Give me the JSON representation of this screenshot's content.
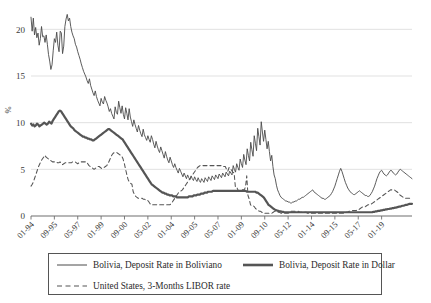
{
  "chart_data": {
    "type": "line",
    "title": "",
    "subtitle": "",
    "xlabel": "",
    "ylabel": "%",
    "ylim": [
      0,
      22.5
    ],
    "yticks": [
      0,
      5,
      10,
      15,
      20
    ],
    "grid": "horizontal",
    "legend_position": "bottom",
    "xtick_labels": [
      "01-94",
      "09-95",
      "05-97",
      "01-99",
      "09-00",
      "05-02",
      "01-04",
      "09-05",
      "05-07",
      "01-09",
      "09-10",
      "05-12",
      "01-14",
      "09-15",
      "05-17",
      "01-19"
    ],
    "x_start": "01-1994",
    "x_end": "2020",
    "x_tick_interval_months": 20,
    "series": [
      {
        "name": "Bolivia, Deposit Rate in Boliviano",
        "style": "solid-thin",
        "color": "#4a4a4a",
        "values": [
          21.3,
          19.8,
          21.2,
          19.4,
          20.2,
          19.1,
          19.6,
          18.3,
          19.0,
          20.3,
          19.2,
          19.3,
          18.6,
          19.4,
          18.4,
          17.3,
          16.6,
          15.7,
          16.2,
          17.7,
          19.0,
          18.6,
          19.7,
          18.3,
          17.6,
          19.8,
          19.6,
          17.4,
          18.2,
          20.3,
          21.1,
          21.6,
          20.9,
          21.2,
          20.3,
          19.7,
          19.3,
          19.0,
          18.4,
          18.1,
          17.6,
          17.2,
          16.8,
          16.3,
          15.9,
          15.5,
          15.2,
          14.9,
          14.5,
          14.2,
          14.7,
          14.0,
          13.6,
          13.2,
          12.9,
          13.4,
          12.8,
          12.4,
          12.1,
          11.8,
          12.6,
          12.2,
          12.0,
          12.8,
          12.4,
          12.1,
          11.7,
          11.2,
          11.5,
          11.0,
          10.7,
          10.4,
          11.7,
          11.1,
          10.9,
          12.3,
          11.6,
          11.0,
          11.8,
          10.9,
          10.4,
          11.6,
          11.0,
          10.3,
          11.5,
          10.6,
          10.1,
          9.6,
          10.3,
          9.8,
          9.4,
          9.0,
          9.7,
          9.2,
          8.8,
          8.5,
          9.3,
          8.7,
          8.4,
          8.1,
          8.6,
          8.2,
          7.9,
          8.6,
          8.2,
          7.7,
          7.3,
          8.0,
          7.5,
          7.1,
          6.8,
          7.4,
          7.0,
          6.6,
          6.2,
          6.9,
          6.4,
          6.0,
          5.7,
          6.3,
          5.9,
          5.5,
          5.2,
          5.6,
          5.2,
          4.9,
          4.6,
          5.1,
          4.8,
          4.5,
          4.2,
          4.6,
          4.3,
          4.0,
          4.4,
          4.1,
          3.9,
          4.3,
          4.0,
          3.8,
          4.2,
          3.9,
          3.7,
          4.1,
          3.8,
          3.6,
          4.0,
          3.8,
          3.6,
          4.1,
          3.9,
          3.7,
          4.2,
          4.0,
          3.8,
          4.3,
          4.1,
          3.9,
          4.4,
          4.2,
          4.0,
          4.5,
          4.3,
          4.1,
          4.6,
          4.4,
          4.2,
          4.7,
          4.5,
          4.3,
          4.8,
          4.6,
          4.4,
          5.4,
          5.0,
          4.7,
          5.6,
          5.2,
          4.9,
          6.1,
          5.6,
          5.2,
          6.6,
          6.0,
          5.5,
          7.2,
          6.5,
          5.9,
          7.9,
          7.1,
          6.4,
          8.6,
          7.8,
          7.0,
          9.4,
          8.5,
          7.6,
          10.1,
          9.0,
          8.0,
          9.2,
          8.2,
          7.2,
          8.0,
          6.9,
          5.9,
          6.5,
          5.3,
          4.4,
          4.0,
          3.3,
          2.8,
          2.5,
          2.2,
          2.0,
          1.9,
          1.8,
          1.7,
          1.6,
          1.6,
          1.5,
          1.5,
          1.4,
          1.4,
          1.5,
          1.5,
          1.6,
          1.6,
          1.7,
          1.8,
          1.8,
          1.9,
          2.0,
          2.0,
          2.1,
          2.2,
          2.3,
          2.4,
          2.5,
          2.6,
          2.7,
          2.8,
          2.6,
          2.5,
          2.4,
          2.3,
          2.2,
          2.1,
          2.0,
          1.9,
          1.9,
          1.8,
          1.8,
          1.9,
          2.0,
          2.1,
          2.2,
          2.4,
          2.6,
          2.9,
          3.2,
          3.6,
          4.0,
          4.4,
          4.8,
          5.1,
          4.8,
          4.4,
          4.0,
          3.6,
          3.3,
          3.0,
          2.8,
          2.6,
          2.5,
          2.4,
          2.3,
          2.3,
          2.4,
          2.5,
          2.6,
          2.7,
          2.6,
          2.5,
          2.4,
          2.3,
          2.2,
          2.2,
          2.1,
          2.1,
          2.2,
          2.4,
          2.6,
          2.9,
          3.2,
          3.6,
          4.0,
          4.3,
          4.6,
          4.8,
          4.9,
          4.7,
          4.5,
          4.4,
          4.3,
          4.4,
          4.6,
          4.8,
          4.9,
          4.8,
          4.6,
          4.5,
          4.4,
          4.5,
          4.7,
          4.9,
          5.0,
          4.9,
          4.8,
          4.7,
          4.6,
          4.5,
          4.4,
          4.3,
          4.2,
          4.1,
          4.0
        ]
      },
      {
        "name": "Bolivia, Deposit Rate in Dollar",
        "style": "solid-thick",
        "color": "#555555",
        "values": [
          9.9,
          9.7,
          9.8,
          9.6,
          9.7,
          9.9,
          9.8,
          9.6,
          9.7,
          9.8,
          9.9,
          10.0,
          9.9,
          9.8,
          9.9,
          10.1,
          10.0,
          9.9,
          10.2,
          10.4,
          10.6,
          10.8,
          11.0,
          11.2,
          11.3,
          11.2,
          11.0,
          10.8,
          10.6,
          10.4,
          10.2,
          10.0,
          9.8,
          9.6,
          9.5,
          9.4,
          9.2,
          9.1,
          9.0,
          8.9,
          8.8,
          8.7,
          8.6,
          8.5,
          8.5,
          8.4,
          8.4,
          8.3,
          8.3,
          8.2,
          8.2,
          8.1,
          8.1,
          8.2,
          8.3,
          8.4,
          8.5,
          8.6,
          8.7,
          8.8,
          8.9,
          9.0,
          9.1,
          9.2,
          9.3,
          9.3,
          9.2,
          9.1,
          9.0,
          8.9,
          8.8,
          8.7,
          8.6,
          8.5,
          8.4,
          8.3,
          8.2,
          8.0,
          7.8,
          7.6,
          7.4,
          7.2,
          7.0,
          6.8,
          6.6,
          6.4,
          6.2,
          6.0,
          5.8,
          5.6,
          5.4,
          5.2,
          5.0,
          4.8,
          4.6,
          4.4,
          4.2,
          4.0,
          3.8,
          3.6,
          3.4,
          3.3,
          3.2,
          3.1,
          3.0,
          2.9,
          2.8,
          2.7,
          2.6,
          2.5,
          2.5,
          2.4,
          2.4,
          2.3,
          2.3,
          2.2,
          2.2,
          2.2,
          2.1,
          2.1,
          2.1,
          2.0,
          2.0,
          2.0,
          2.0,
          2.0,
          2.0,
          2.0,
          2.0,
          2.0,
          2.0,
          2.1,
          2.1,
          2.1,
          2.1,
          2.2,
          2.2,
          2.2,
          2.3,
          2.3,
          2.3,
          2.4,
          2.4,
          2.4,
          2.5,
          2.5,
          2.5,
          2.6,
          2.6,
          2.6,
          2.6,
          2.7,
          2.7,
          2.7,
          2.7,
          2.7,
          2.7,
          2.7,
          2.7,
          2.7,
          2.7,
          2.7,
          2.7,
          2.7,
          2.7,
          2.7,
          2.7,
          2.7,
          2.7,
          2.7,
          2.7,
          2.7,
          2.7,
          2.7,
          2.7,
          2.7,
          2.7,
          2.7,
          2.7,
          2.6,
          2.6,
          2.6,
          2.6,
          2.6,
          2.6,
          2.6,
          2.6,
          2.5,
          2.5,
          2.4,
          2.3,
          2.2,
          2.1,
          2.0,
          1.8,
          1.6,
          1.4,
          1.2,
          1.1,
          1.0,
          0.9,
          0.8,
          0.7,
          0.65,
          0.6,
          0.55,
          0.5,
          0.5,
          0.45,
          0.45,
          0.4,
          0.4,
          0.4,
          0.4,
          0.4,
          0.4,
          0.4,
          0.4,
          0.4,
          0.4,
          0.4,
          0.4,
          0.4,
          0.4,
          0.4,
          0.4,
          0.4,
          0.4,
          0.4,
          0.4,
          0.4,
          0.4,
          0.4,
          0.4,
          0.4,
          0.4,
          0.4,
          0.4,
          0.4,
          0.4,
          0.4,
          0.4,
          0.4,
          0.4,
          0.4,
          0.4,
          0.4,
          0.4,
          0.4,
          0.4,
          0.4,
          0.4,
          0.4,
          0.4,
          0.4,
          0.4,
          0.4,
          0.4,
          0.4,
          0.4,
          0.4,
          0.4,
          0.4,
          0.4,
          0.4,
          0.4,
          0.4,
          0.4,
          0.4,
          0.4,
          0.4,
          0.4,
          0.4,
          0.4,
          0.4,
          0.4,
          0.4,
          0.4,
          0.4,
          0.4,
          0.4,
          0.4,
          0.4,
          0.4,
          0.45,
          0.45,
          0.5,
          0.5,
          0.55,
          0.55,
          0.6,
          0.6,
          0.65,
          0.65,
          0.7,
          0.7,
          0.75,
          0.75,
          0.8,
          0.8,
          0.85,
          0.85,
          0.9,
          0.9,
          0.95,
          1.0,
          1.0,
          1.05,
          1.1,
          1.1,
          1.15,
          1.2,
          1.2,
          1.25,
          1.3,
          1.3,
          1.3
        ]
      },
      {
        "name": "United States, 3-Months LIBOR rate",
        "style": "dashed",
        "color": "#555555",
        "values": [
          3.2,
          3.4,
          3.7,
          4.1,
          4.5,
          4.9,
          5.3,
          5.6,
          5.9,
          6.1,
          6.3,
          6.5,
          6.3,
          6.2,
          6.1,
          6.0,
          5.9,
          5.8,
          5.8,
          5.8,
          5.8,
          5.7,
          5.7,
          5.8,
          5.6,
          5.5,
          5.6,
          5.7,
          5.7,
          5.7,
          5.7,
          5.7,
          5.7,
          5.8,
          5.8,
          5.8,
          5.7,
          5.6,
          5.7,
          5.8,
          5.8,
          5.8,
          5.8,
          5.8,
          5.8,
          5.6,
          5.4,
          5.3,
          5.2,
          5.1,
          5.0,
          5.1,
          5.2,
          5.3,
          5.3,
          5.2,
          5.1,
          5.1,
          5.2,
          5.3,
          5.4,
          5.6,
          5.9,
          6.2,
          6.5,
          6.7,
          6.8,
          6.8,
          6.8,
          6.7,
          6.6,
          6.5,
          6.4,
          6.1,
          5.6,
          5.0,
          4.4,
          3.9,
          3.6,
          3.5,
          3.4,
          2.6,
          2.3,
          2.1,
          2.0,
          1.9,
          1.9,
          1.9,
          1.9,
          1.8,
          1.8,
          1.7,
          1.7,
          1.6,
          1.4,
          1.2,
          1.2,
          1.2,
          1.2,
          1.2,
          1.2,
          1.2,
          1.2,
          1.2,
          1.2,
          1.2,
          1.2,
          1.2,
          1.2,
          1.2,
          1.2,
          1.3,
          1.5,
          1.7,
          1.9,
          2.1,
          2.3,
          2.5,
          2.6,
          2.7,
          2.8,
          3.0,
          3.2,
          3.4,
          3.6,
          3.8,
          4.0,
          4.2,
          4.4,
          4.6,
          4.8,
          5.0,
          5.2,
          5.3,
          5.4,
          5.4,
          5.4,
          5.4,
          5.4,
          5.4,
          5.4,
          5.4,
          5.4,
          5.4,
          5.4,
          5.4,
          5.4,
          5.4,
          5.4,
          5.4,
          5.4,
          5.4,
          5.3,
          5.3,
          5.3,
          5.0,
          4.8,
          5.2,
          5.1,
          4.9,
          4.7,
          4.6,
          3.1,
          3.1,
          2.8,
          2.7,
          2.7,
          2.8,
          2.8,
          2.8,
          3.1,
          4.3,
          2.2,
          1.8,
          1.2,
          1.1,
          1.1,
          1.0,
          0.8,
          0.7,
          0.6,
          0.5,
          0.5,
          0.4,
          0.3,
          0.3,
          0.3,
          0.3,
          0.3,
          0.3,
          0.3,
          0.3,
          0.4,
          0.5,
          0.5,
          0.5,
          0.4,
          0.4,
          0.3,
          0.3,
          0.3,
          0.3,
          0.3,
          0.3,
          0.3,
          0.4,
          0.5,
          0.5,
          0.5,
          0.5,
          0.5,
          0.5,
          0.5,
          0.4,
          0.4,
          0.4,
          0.4,
          0.4,
          0.4,
          0.3,
          0.3,
          0.3,
          0.3,
          0.3,
          0.3,
          0.3,
          0.3,
          0.3,
          0.3,
          0.3,
          0.3,
          0.3,
          0.3,
          0.3,
          0.3,
          0.3,
          0.3,
          0.3,
          0.3,
          0.3,
          0.3,
          0.3,
          0.3,
          0.3,
          0.3,
          0.3,
          0.3,
          0.3,
          0.3,
          0.3,
          0.4,
          0.4,
          0.5,
          0.5,
          0.6,
          0.6,
          0.6,
          0.6,
          0.6,
          0.7,
          0.7,
          0.8,
          0.9,
          1.0,
          1.0,
          1.0,
          1.1,
          1.2,
          1.2,
          1.3,
          1.3,
          1.4,
          1.5,
          1.6,
          1.7,
          1.8,
          1.9,
          2.0,
          2.1,
          2.2,
          2.3,
          2.4,
          2.5,
          2.6,
          2.7,
          2.8,
          2.8,
          2.8,
          2.8,
          2.7,
          2.6,
          2.5,
          2.3,
          2.2,
          2.1,
          2.0,
          2.0,
          1.9,
          1.9,
          1.9,
          1.9,
          1.9,
          1.9
        ]
      }
    ]
  },
  "legend": {
    "items": [
      {
        "label": "Bolivia, Deposit Rate in Boliviano",
        "style": "solid-thin"
      },
      {
        "label": "Bolivia, Deposit Rate in Dollar",
        "style": "solid-thick"
      },
      {
        "label": "United States, 3-Months LIBOR rate",
        "style": "dashed"
      }
    ]
  }
}
